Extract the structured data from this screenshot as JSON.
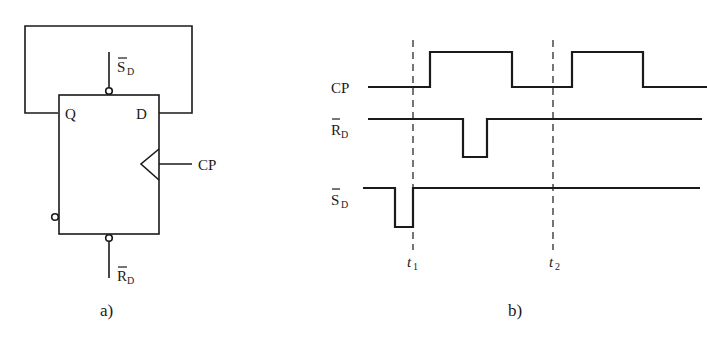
{
  "panel_a": {
    "caption": "a)",
    "pins": {
      "q": "Q",
      "d": "D",
      "cp": "CP",
      "sd_main": "S",
      "sd_sub": "D",
      "rd_main": "R",
      "rd_sub": "D"
    }
  },
  "panel_b": {
    "caption": "b)",
    "signals": [
      {
        "name": "CP",
        "main": "CP",
        "sub": "",
        "overbar": false
      },
      {
        "name": "RD_bar",
        "main": "R",
        "sub": "D",
        "overbar": true
      },
      {
        "name": "SD_bar",
        "main": "S",
        "sub": "D",
        "overbar": true
      }
    ],
    "markers": [
      {
        "main": "t",
        "sub": "1"
      },
      {
        "main": "t",
        "sub": "2"
      }
    ]
  },
  "colors": {
    "stroke": "#1a1a1a",
    "background": "#ffffff"
  }
}
